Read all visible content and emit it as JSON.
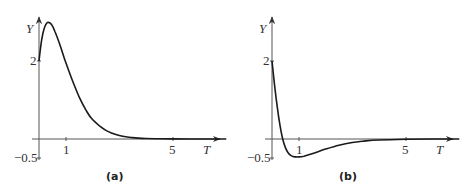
{
  "chart_data": [
    {
      "type": "line",
      "panel_label": "(a)",
      "xlabel": "T",
      "ylabel": "Y",
      "x_ticks": [
        "1",
        "5"
      ],
      "y_ticks": [
        "2",
        "-0.5"
      ],
      "xlim": [
        0,
        7.1
      ],
      "ylim": [
        -0.5,
        3.15
      ],
      "grid": false,
      "series": [
        {
          "name": "Y(T)",
          "x": [
            0,
            0.1,
            0.2,
            0.3,
            0.4,
            0.5,
            0.6,
            0.8,
            1.0,
            1.25,
            1.5,
            1.75,
            2.0,
            2.5,
            3.0,
            3.5,
            4.0,
            4.5,
            5.0,
            6.0,
            7.0
          ],
          "y": [
            2.0,
            2.55,
            2.85,
            2.98,
            2.98,
            2.9,
            2.75,
            2.38,
            1.96,
            1.5,
            1.08,
            0.75,
            0.5,
            0.22,
            0.09,
            0.035,
            0.013,
            0.005,
            0.002,
            0.0,
            0.0
          ]
        }
      ]
    },
    {
      "type": "line",
      "panel_label": "(b)",
      "xlabel": "T",
      "ylabel": "Y",
      "x_ticks": [
        "1",
        "5"
      ],
      "y_ticks": [
        "2",
        "-0.5"
      ],
      "xlim": [
        0,
        7.1
      ],
      "ylim": [
        -0.5,
        3.15
      ],
      "grid": false,
      "series": [
        {
          "name": "Y(T)",
          "x": [
            0,
            0.1,
            0.2,
            0.3,
            0.4,
            0.5,
            0.6,
            0.7,
            0.8,
            1.0,
            1.2,
            1.5,
            2.0,
            2.5,
            3.0,
            3.5,
            4.0,
            5.0,
            6.0,
            7.0
          ],
          "y": [
            2.0,
            1.35,
            0.8,
            0.35,
            0.0,
            -0.22,
            -0.35,
            -0.42,
            -0.45,
            -0.46,
            -0.44,
            -0.38,
            -0.26,
            -0.16,
            -0.09,
            -0.05,
            -0.025,
            -0.006,
            0.0,
            0.0
          ]
        }
      ]
    }
  ],
  "colors": {
    "curve": "#1a1a1a",
    "axis": "#555555",
    "text": "#333333"
  }
}
